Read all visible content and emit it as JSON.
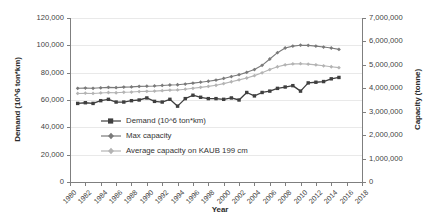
{
  "chart_data": {
    "type": "line",
    "title": "",
    "xlabel": "Year",
    "ylabel": "Demand (10^6 ton*km)",
    "y2label": "Capacity (tonne)",
    "xlim": [
      1980,
      2018
    ],
    "ylim": [
      0,
      120000
    ],
    "y2lim": [
      0,
      7000000
    ],
    "grid": true,
    "legend_position": "center-left-inside",
    "x_ticks": [
      "1980",
      "1982",
      "1984",
      "1986",
      "1988",
      "1990",
      "1992",
      "1994",
      "1996",
      "1998",
      "2000",
      "2002",
      "2004",
      "2006",
      "2008",
      "2010",
      "2012",
      "2014",
      "2016",
      "2018"
    ],
    "y_ticks": [
      "0",
      "20,000",
      "40,000",
      "60,000",
      "80,000",
      "100,000",
      "120,000"
    ],
    "y2_ticks": [
      "0",
      "1,000,000",
      "2,000,000",
      "3,000,000",
      "4,000,000",
      "5,000,000",
      "6,000,000",
      "7,000,000"
    ],
    "x": [
      1981,
      1982,
      1983,
      1984,
      1985,
      1986,
      1987,
      1988,
      1989,
      1990,
      1991,
      1992,
      1993,
      1994,
      1995,
      1996,
      1997,
      1998,
      1999,
      2000,
      2001,
      2002,
      2003,
      2004,
      2005,
      2006,
      2007,
      2008,
      2009,
      2010,
      2011,
      2012,
      2013,
      2014,
      2015
    ],
    "series": [
      {
        "name": "Demand (10^6 ton*km)",
        "axis": "left",
        "color": "#3f3f3f",
        "marker": "square",
        "values": [
          57500,
          58000,
          57500,
          59500,
          60500,
          58500,
          58500,
          59500,
          60000,
          61500,
          59000,
          58500,
          60500,
          55500,
          61000,
          63500,
          62000,
          61000,
          61000,
          60500,
          61500,
          60000,
          65500,
          63000,
          65500,
          66500,
          68500,
          69500,
          70500,
          66500,
          72500,
          73000,
          73500,
          75500,
          76500
        ]
      },
      {
        "name": "Max capacity",
        "axis": "right",
        "color": "#7a7a7a",
        "marker": "diamond",
        "values": [
          4000000,
          4010000,
          4000000,
          4020000,
          4040000,
          4030000,
          4050000,
          4060000,
          4080000,
          4090000,
          4100000,
          4120000,
          4140000,
          4150000,
          4180000,
          4220000,
          4260000,
          4300000,
          4350000,
          4420000,
          4500000,
          4580000,
          4680000,
          4800000,
          4980000,
          5250000,
          5520000,
          5720000,
          5800000,
          5840000,
          5830000,
          5800000,
          5760000,
          5720000,
          5660000
        ]
      },
      {
        "name": "Average capacity on KAUB 199 cm",
        "axis": "right",
        "color": "#b4b4b4",
        "marker": "diamond",
        "values": [
          3780000,
          3790000,
          3780000,
          3800000,
          3820000,
          3810000,
          3830000,
          3840000,
          3860000,
          3870000,
          3880000,
          3900000,
          3920000,
          3930000,
          3960000,
          4000000,
          4040000,
          4080000,
          4130000,
          4200000,
          4280000,
          4360000,
          4440000,
          4540000,
          4660000,
          4800000,
          4920000,
          5000000,
          5040000,
          5050000,
          5030000,
          5000000,
          4960000,
          4920000,
          4880000
        ]
      }
    ]
  },
  "legend": {
    "items": [
      {
        "label": "Demand (10^6 ton*km)"
      },
      {
        "label": "Max capacity"
      },
      {
        "label": "Average capacity on KAUB 199 cm"
      }
    ]
  },
  "axes": {
    "y_left_title": "Demand (10^6 ton*km)",
    "y_right_title": "Capacity (tonne)",
    "x_title": "Year"
  }
}
